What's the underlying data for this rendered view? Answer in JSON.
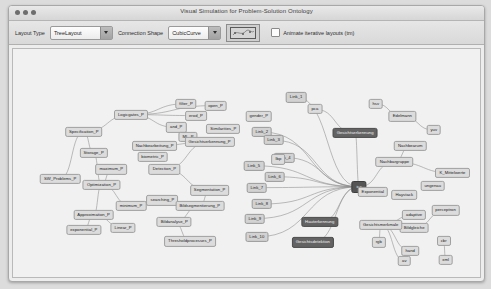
{
  "window": {
    "title": "Visual Simulation for Problem-Solution Ontology",
    "traffic_lights": [
      "close-button",
      "minimize-button",
      "zoom-button"
    ]
  },
  "toolbar": {
    "layout_type_label": "Layout Type",
    "layout_type_value": "TreeLayout",
    "layout_type_options": [
      "TreeLayout"
    ],
    "connection_shape_label": "Connection Shape",
    "connection_shape_value": "CubicCurve",
    "connection_shape_options": [
      "CubicCurve"
    ],
    "animate_checkbox_label": "Animate iterative layouts (tm)",
    "animate_checkbox_checked": false,
    "preview_name": "layout-preview-thumbnail"
  },
  "graph": {
    "node_kinds": {
      "p": "problem-node",
      "s": "solution-node",
      "l": "link-node",
      "hub": "hub-node"
    },
    "colors": {
      "problem_node": "#dcdcdc",
      "solution_node": "#636363",
      "link_node": "#d2d2d2",
      "hub_node": "#555555",
      "edge": "#8c8c8c",
      "canvas": "#f1f1f1"
    },
    "nodes": [
      {
        "label": "Logicgates_P",
        "x": 120,
        "y": 72,
        "kind": "p"
      },
      {
        "label": "filter_P",
        "x": 176,
        "y": 60,
        "kind": "p"
      },
      {
        "label": "open_P",
        "x": 206,
        "y": 62,
        "kind": "p"
      },
      {
        "label": "erod_P",
        "x": 186,
        "y": 73,
        "kind": "p"
      },
      {
        "label": "and_P",
        "x": 166,
        "y": 86,
        "kind": "p"
      },
      {
        "label": "ML_P",
        "x": 178,
        "y": 96,
        "kind": "p"
      },
      {
        "label": "Similarities_P",
        "x": 214,
        "y": 88,
        "kind": "p"
      },
      {
        "label": "gender_P",
        "x": 250,
        "y": 74,
        "kind": "p"
      },
      {
        "label": "Specification_P",
        "x": 72,
        "y": 91,
        "kind": "p"
      },
      {
        "label": "Nachbearbeitung_P",
        "x": 144,
        "y": 106,
        "kind": "p"
      },
      {
        "label": "Gesichtserkennung_P",
        "x": 200,
        "y": 102,
        "kind": "p"
      },
      {
        "label": "Storage_P",
        "x": 82,
        "y": 114,
        "kind": "p"
      },
      {
        "label": "biometric_P",
        "x": 142,
        "y": 118,
        "kind": "p"
      },
      {
        "label": "maximum_P",
        "x": 100,
        "y": 132,
        "kind": "p"
      },
      {
        "label": "Detection_P",
        "x": 154,
        "y": 132,
        "kind": "p"
      },
      {
        "label": "SW_Problems_P",
        "x": 48,
        "y": 142,
        "kind": "p"
      },
      {
        "label": "Optimization_P",
        "x": 90,
        "y": 149,
        "kind": "p"
      },
      {
        "label": "Segmentation_P",
        "x": 200,
        "y": 155,
        "kind": "p"
      },
      {
        "label": "searching_P",
        "x": 152,
        "y": 166,
        "kind": "p"
      },
      {
        "label": "minimum_P",
        "x": 120,
        "y": 172,
        "kind": "p"
      },
      {
        "label": "Bildsegmentierung_P",
        "x": 190,
        "y": 172,
        "kind": "p"
      },
      {
        "label": "Approximation_P",
        "x": 82,
        "y": 182,
        "kind": "p"
      },
      {
        "label": "Linear_P",
        "x": 112,
        "y": 196,
        "kind": "p"
      },
      {
        "label": "exponential_P",
        "x": 72,
        "y": 198,
        "kind": "p"
      },
      {
        "label": "Bildanalyse_P",
        "x": 164,
        "y": 190,
        "kind": "p"
      },
      {
        "label": "Thresholdprocesses_P",
        "x": 180,
        "y": 211,
        "kind": "p"
      },
      {
        "label": "Link_1",
        "x": 288,
        "y": 53,
        "kind": "l"
      },
      {
        "label": "Link_2",
        "x": 253,
        "y": 91,
        "kind": "l"
      },
      {
        "label": "Link_3",
        "x": 265,
        "y": 100,
        "kind": "l"
      },
      {
        "label": "Link_4",
        "x": 276,
        "y": 119,
        "kind": "l"
      },
      {
        "label": "Link_5",
        "x": 245,
        "y": 128,
        "kind": "l"
      },
      {
        "label": "Link_6",
        "x": 266,
        "y": 140,
        "kind": "l"
      },
      {
        "label": "Link_7",
        "x": 248,
        "y": 152,
        "kind": "l"
      },
      {
        "label": "Link_8",
        "x": 253,
        "y": 170,
        "kind": "l"
      },
      {
        "label": "Link_9",
        "x": 246,
        "y": 186,
        "kind": "l"
      },
      {
        "label": "Link_10",
        "x": 248,
        "y": 206,
        "kind": "l"
      },
      {
        "label": "pca",
        "x": 307,
        "y": 66,
        "kind": "p"
      },
      {
        "label": "lbp",
        "x": 270,
        "y": 121,
        "kind": "p"
      },
      {
        "label": "Gesichtserkennung",
        "x": 348,
        "y": 92,
        "kind": "s"
      },
      {
        "label": "ica",
        "x": 352,
        "y": 151,
        "kind": "hub"
      },
      {
        "label": "Hauterkennung",
        "x": 312,
        "y": 190,
        "kind": "s"
      },
      {
        "label": "Gesichtsdetektion",
        "x": 305,
        "y": 212,
        "kind": "s"
      },
      {
        "label": "Exponential",
        "x": 366,
        "y": 157,
        "kind": "p"
      },
      {
        "label": "hsv",
        "x": 369,
        "y": 60,
        "kind": "p"
      },
      {
        "label": "Edelmann",
        "x": 396,
        "y": 74,
        "kind": "p"
      },
      {
        "label": "yuv",
        "x": 428,
        "y": 89,
        "kind": "p"
      },
      {
        "label": "Nachbearum",
        "x": 404,
        "y": 106,
        "kind": "p"
      },
      {
        "label": "Nachbargruppe",
        "x": 388,
        "y": 124,
        "kind": "p"
      },
      {
        "label": "K_Mittelwerte",
        "x": 447,
        "y": 136,
        "kind": "p"
      },
      {
        "label": "Haystack",
        "x": 398,
        "y": 160,
        "kind": "p"
      },
      {
        "label": "ungenau",
        "x": 427,
        "y": 150,
        "kind": "p"
      },
      {
        "label": "perceptron",
        "x": 440,
        "y": 177,
        "kind": "p"
      },
      {
        "label": "Bildgleiche",
        "x": 408,
        "y": 196,
        "kind": "p"
      },
      {
        "label": "adaptive",
        "x": 408,
        "y": 182,
        "kind": "p"
      },
      {
        "label": "Gesichtsmerkmale",
        "x": 374,
        "y": 193,
        "kind": "p"
      },
      {
        "label": "rgb",
        "x": 372,
        "y": 212,
        "kind": "p"
      },
      {
        "label": "hand",
        "x": 404,
        "y": 221,
        "kind": "p"
      },
      {
        "label": "cbr",
        "x": 438,
        "y": 210,
        "kind": "p"
      },
      {
        "label": "av",
        "x": 398,
        "y": 232,
        "kind": "p"
      },
      {
        "label": "xml",
        "x": 440,
        "y": 231,
        "kind": "p"
      }
    ],
    "edges": [
      {
        "from": "Specification_P",
        "to": "Logicgates_P"
      },
      {
        "from": "Logicgates_P",
        "to": "filter_P"
      },
      {
        "from": "Logicgates_P",
        "to": "erod_P"
      },
      {
        "from": "Logicgates_P",
        "to": "open_P"
      },
      {
        "from": "Logicgates_P",
        "to": "and_P"
      },
      {
        "from": "Specification_P",
        "to": "Storage_P"
      },
      {
        "from": "Specification_P",
        "to": "SW_Problems_P"
      },
      {
        "from": "Storage_P",
        "to": "Optimization_P"
      },
      {
        "from": "Optimization_P",
        "to": "maximum_P"
      },
      {
        "from": "Optimization_P",
        "to": "minimum_P"
      },
      {
        "from": "Optimization_P",
        "to": "Approximation_P"
      },
      {
        "from": "Approximation_P",
        "to": "Linear_P"
      },
      {
        "from": "Approximation_P",
        "to": "exponential_P"
      },
      {
        "from": "Nachbearbeitung_P",
        "to": "Gesichtserkennung_P"
      },
      {
        "from": "Gesichtserkennung_P",
        "to": "Detection_P"
      },
      {
        "from": "Detection_P",
        "to": "Segmentation_P"
      },
      {
        "from": "Segmentation_P",
        "to": "Bildsegmentierung_P"
      },
      {
        "from": "Bildsegmentierung_P",
        "to": "Bildanalyse_P"
      },
      {
        "from": "Bildanalyse_P",
        "to": "Thresholdprocesses_P"
      },
      {
        "from": "Link_1",
        "to": "ica"
      },
      {
        "from": "Link_2",
        "to": "ica"
      },
      {
        "from": "Link_3",
        "to": "ica"
      },
      {
        "from": "Link_4",
        "to": "ica"
      },
      {
        "from": "Link_5",
        "to": "ica"
      },
      {
        "from": "Link_6",
        "to": "ica"
      },
      {
        "from": "Link_7",
        "to": "ica"
      },
      {
        "from": "Link_8",
        "to": "ica"
      },
      {
        "from": "Link_9",
        "to": "ica"
      },
      {
        "from": "Link_10",
        "to": "ica"
      },
      {
        "from": "ica",
        "to": "Gesichtserkennung"
      },
      {
        "from": "ica",
        "to": "Exponential"
      },
      {
        "from": "ica",
        "to": "Hauterkennung"
      },
      {
        "from": "ica",
        "to": "Gesichtsdetektion"
      },
      {
        "from": "ica",
        "to": "Nachbargruppe"
      },
      {
        "from": "Gesichtserkennung",
        "to": "pca"
      },
      {
        "from": "hsv",
        "to": "Edelmann"
      },
      {
        "from": "Edelmann",
        "to": "yuv"
      },
      {
        "from": "Nachbearum",
        "to": "Nachbargruppe"
      },
      {
        "from": "Nachbargruppe",
        "to": "K_Mittelwerte"
      },
      {
        "from": "Gesichtsmerkmale",
        "to": "adaptive"
      },
      {
        "from": "Gesichtsmerkmale",
        "to": "rgb"
      },
      {
        "from": "Gesichtsmerkmale",
        "to": "hand"
      },
      {
        "from": "Gesichtsmerkmale",
        "to": "av"
      },
      {
        "from": "Bildgleiche",
        "to": "perceptron"
      },
      {
        "from": "cbr",
        "to": "xml"
      }
    ]
  }
}
